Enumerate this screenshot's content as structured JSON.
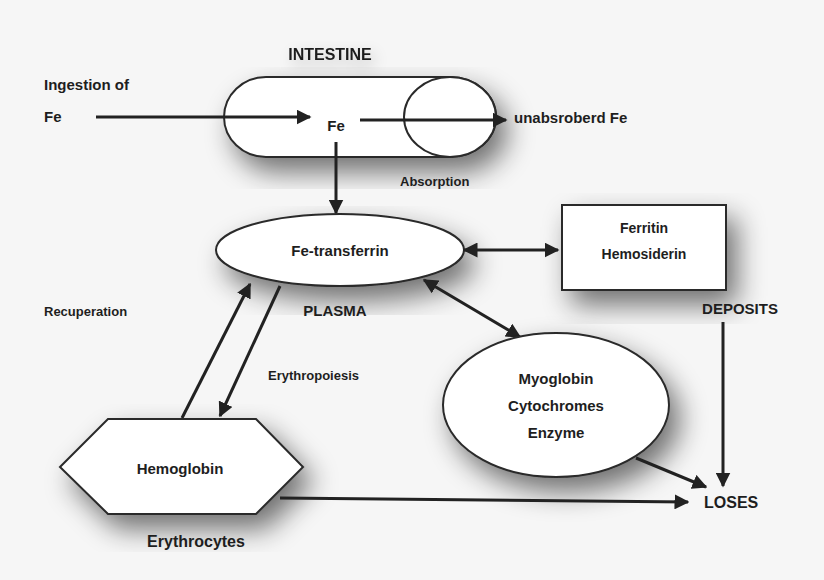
{
  "diagram": {
    "title": "INTESTINE",
    "nodes": {
      "ingestion": {
        "line1": "Ingestion of",
        "line2": "Fe"
      },
      "intestine_fe": "Fe",
      "unabsorbed": "unabsroberd Fe",
      "absorption": "Absorption",
      "transferrin": "Fe-transferrin",
      "plasma": "PLASMA",
      "deposits_box": {
        "line1": "Ferritin",
        "line2": "Hemosiderin"
      },
      "deposits": "DEPOSITS",
      "recuperation": "Recuperation",
      "erythropoiesis": "Erythropoiesis",
      "tissue": {
        "line1": "Myoglobin",
        "line2": "Cytochromes",
        "line3": "Enzyme"
      },
      "hemoglobin": "Hemoglobin",
      "erythrocytes": "Erythrocytes",
      "loses": "LOSES"
    },
    "edges": [
      {
        "from": "Ingestion of Fe",
        "to": "Fe (intestine)",
        "type": "arrow"
      },
      {
        "from": "Fe (intestine)",
        "to": "unabsroberd Fe",
        "type": "arrow"
      },
      {
        "from": "Fe (intestine)",
        "to": "Fe-transferrin",
        "type": "arrow",
        "label": "Absorption"
      },
      {
        "from": "Fe-transferrin",
        "to": "Ferritin Hemosiderin",
        "type": "bidirectional"
      },
      {
        "from": "Fe-transferrin",
        "to": "Myoglobin Cytochromes Enzyme",
        "type": "bidirectional"
      },
      {
        "from": "Hemoglobin",
        "to": "Fe-transferrin",
        "type": "arrow",
        "label": "Recuperation"
      },
      {
        "from": "Fe-transferrin",
        "to": "Hemoglobin",
        "type": "arrow",
        "label": "Erythropoiesis"
      },
      {
        "from": "Ferritin Hemosiderin",
        "to": "LOSES",
        "type": "arrow"
      },
      {
        "from": "Myoglobin Cytochromes Enzyme",
        "to": "LOSES",
        "type": "arrow"
      },
      {
        "from": "Hemoglobin",
        "to": "LOSES",
        "type": "arrow"
      }
    ]
  }
}
